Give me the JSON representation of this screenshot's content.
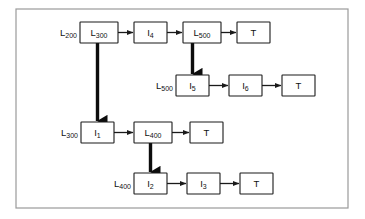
{
  "diagram": {
    "frame": {
      "x": 16,
      "y": 9,
      "width": 332,
      "height": 199,
      "color": "#9a9a9a"
    },
    "colors": {
      "box_stroke": "#1a1a1a",
      "box_fill": "#ffffff",
      "thin_arrow": "#1a1a1a",
      "thick_arrow": "#0d0d0d",
      "text": "#111111",
      "background": "#ffffff"
    },
    "rows": [
      {
        "id": "row-1",
        "entry_label": {
          "base": "L",
          "sub": "200",
          "text": "L200"
        },
        "nodes": [
          {
            "id": "n-l300",
            "base": "L",
            "sub": "300",
            "text": "L300",
            "x": 80,
            "y": 22,
            "w": 38,
            "h": 21
          },
          {
            "id": "n-i4",
            "base": "I",
            "sub": "4",
            "text": "I4",
            "x": 134,
            "y": 22,
            "w": 33,
            "h": 21
          },
          {
            "id": "n-l500-top",
            "base": "L",
            "sub": "500",
            "text": "L500",
            "x": 183,
            "y": 22,
            "w": 38,
            "h": 21
          },
          {
            "id": "n-t1",
            "base": "T",
            "sub": "",
            "text": "T",
            "x": 237,
            "y": 22,
            "w": 33,
            "h": 21
          }
        ]
      },
      {
        "id": "row-2",
        "entry_label": {
          "base": "L",
          "sub": "500",
          "text": "L500"
        },
        "nodes": [
          {
            "id": "n-i5",
            "base": "I",
            "sub": "5",
            "text": "I5",
            "x": 176,
            "y": 75,
            "w": 33,
            "h": 21
          },
          {
            "id": "n-i6",
            "base": "I",
            "sub": "6",
            "text": "I6",
            "x": 229,
            "y": 75,
            "w": 33,
            "h": 21
          },
          {
            "id": "n-t2",
            "base": "T",
            "sub": "",
            "text": "T",
            "x": 282,
            "y": 75,
            "w": 33,
            "h": 21
          }
        ]
      },
      {
        "id": "row-3",
        "entry_label": {
          "base": "L",
          "sub": "300",
          "text": "L300"
        },
        "nodes": [
          {
            "id": "n-i1",
            "base": "I",
            "sub": "1",
            "text": "I1",
            "x": 81,
            "y": 122,
            "w": 33,
            "h": 21
          },
          {
            "id": "n-l400",
            "base": "L",
            "sub": "400",
            "text": "L400",
            "x": 134,
            "y": 122,
            "w": 38,
            "h": 21
          },
          {
            "id": "n-t3",
            "base": "T",
            "sub": "",
            "text": "T",
            "x": 190,
            "y": 122,
            "w": 33,
            "h": 21
          }
        ]
      },
      {
        "id": "row-4",
        "entry_label": {
          "base": "L",
          "sub": "400",
          "text": "L400"
        },
        "nodes": [
          {
            "id": "n-i2",
            "base": "I",
            "sub": "2",
            "text": "I2",
            "x": 134,
            "y": 173,
            "w": 33,
            "h": 21
          },
          {
            "id": "n-i3",
            "base": "I",
            "sub": "3",
            "text": "I3",
            "x": 187,
            "y": 173,
            "w": 33,
            "h": 21
          },
          {
            "id": "n-t4",
            "base": "T",
            "sub": "",
            "text": "T",
            "x": 240,
            "y": 173,
            "w": 33,
            "h": 21
          }
        ]
      }
    ],
    "connections": [
      {
        "id": "c-l300-i4",
        "kind": "thin",
        "from": "n-l300",
        "to": "n-i4",
        "orientation": "horizontal"
      },
      {
        "id": "c-i4-l500",
        "kind": "thin",
        "from": "n-i4",
        "to": "n-l500-top",
        "orientation": "horizontal"
      },
      {
        "id": "c-l500-t1",
        "kind": "thin",
        "from": "n-l500-top",
        "to": "n-t1",
        "orientation": "horizontal"
      },
      {
        "id": "c-l500-i5",
        "kind": "thick",
        "from": "n-l500-top",
        "to": "n-i5",
        "orientation": "vertical"
      },
      {
        "id": "c-i5-i6",
        "kind": "thin",
        "from": "n-i5",
        "to": "n-i6",
        "orientation": "horizontal"
      },
      {
        "id": "c-i6-t2",
        "kind": "thin",
        "from": "n-i6",
        "to": "n-t2",
        "orientation": "horizontal"
      },
      {
        "id": "c-l300-i1",
        "kind": "thick",
        "from": "n-l300",
        "to": "n-i1",
        "orientation": "vertical"
      },
      {
        "id": "c-i1-l400",
        "kind": "thin",
        "from": "n-i1",
        "to": "n-l400",
        "orientation": "horizontal"
      },
      {
        "id": "c-l400-t3",
        "kind": "thin",
        "from": "n-l400",
        "to": "n-t3",
        "orientation": "horizontal"
      },
      {
        "id": "c-l400-i2",
        "kind": "thick",
        "from": "n-l400",
        "to": "n-i2",
        "orientation": "vertical"
      },
      {
        "id": "c-i2-i3",
        "kind": "thin",
        "from": "n-i2",
        "to": "n-i3",
        "orientation": "horizontal"
      },
      {
        "id": "c-i3-t4",
        "kind": "thin",
        "from": "n-i3",
        "to": "n-t4",
        "orientation": "horizontal"
      }
    ]
  }
}
